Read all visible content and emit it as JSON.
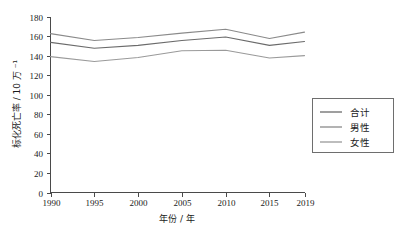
{
  "chart_data": {
    "type": "line",
    "title": "",
    "xlabel": "年份 / 年",
    "ylabel": "标化死亡率 / 10 万 ⁻¹",
    "x": [
      1990,
      1995,
      2000,
      2005,
      2010,
      2015,
      2019
    ],
    "xtick_labels": [
      "1990",
      "1995",
      "2000",
      "2005",
      "2010",
      "2015",
      "2019"
    ],
    "ytick_labels": [
      "0",
      "20",
      "40",
      "60",
      "80",
      "100",
      "120",
      "140",
      "160",
      "180"
    ],
    "yticks": [
      0,
      20,
      40,
      60,
      80,
      100,
      120,
      140,
      160,
      180
    ],
    "ylim": [
      0,
      180
    ],
    "xlim": [
      1990,
      2019
    ],
    "grid": false,
    "legend_position": "right-outside",
    "series": [
      {
        "name": "合计",
        "color": "#6b6b6b",
        "values": [
          153.5,
          147.5,
          150.5,
          155.5,
          159.0,
          150.5,
          154.5
        ]
      },
      {
        "name": "男性",
        "color": "#8a8a8a",
        "values": [
          162.5,
          155.5,
          158.5,
          163.0,
          167.0,
          157.5,
          164.0
        ]
      },
      {
        "name": "女性",
        "color": "#9a9a9a",
        "values": [
          139.0,
          134.0,
          138.0,
          145.0,
          145.5,
          137.5,
          140.0
        ]
      }
    ]
  },
  "legend": {
    "items": [
      {
        "label": "合计"
      },
      {
        "label": "男性"
      },
      {
        "label": "女性"
      }
    ]
  },
  "axes": {
    "x_title": "年份 / 年",
    "y_title": "标化死亡率 / 10 万 ⁻¹"
  }
}
